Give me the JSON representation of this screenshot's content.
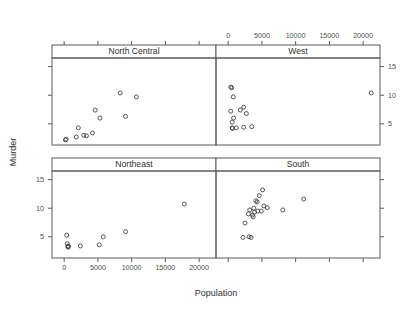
{
  "chart_data": {
    "type": "scatter",
    "title": "",
    "xlabel": "Population",
    "ylabel": "Murder",
    "xlim": [
      -1800,
      22500
    ],
    "ylim": [
      1.3,
      16.5
    ],
    "xticks": [
      0,
      5000,
      10000,
      15000,
      20000
    ],
    "xtick_labels": [
      "0",
      "5000",
      "10000",
      "15000",
      "20000"
    ],
    "yticks": [
      5,
      10,
      15
    ],
    "ytick_labels": [
      "5",
      "10",
      "15"
    ],
    "grid": false,
    "legend": "none",
    "layout": {
      "rows": 2,
      "cols": 2,
      "x_axis_labelled_panels": [
        "North Central",
        "West"
      ],
      "x_axis_label_position": "top-right and bottom-left alternating",
      "y_axis_label_position": "right-top and left-bottom alternating"
    },
    "panels": [
      {
        "name": "North Central",
        "row": 0,
        "col": 0,
        "points": [
          {
            "x": 200,
            "y": 2.2
          },
          {
            "x": 280,
            "y": 2.3
          },
          {
            "x": 1800,
            "y": 2.7
          },
          {
            "x": 2900,
            "y": 3.0
          },
          {
            "x": 3300,
            "y": 2.9
          },
          {
            "x": 4200,
            "y": 3.4
          },
          {
            "x": 2100,
            "y": 4.3
          },
          {
            "x": 5300,
            "y": 6.0
          },
          {
            "x": 4600,
            "y": 7.4
          },
          {
            "x": 9100,
            "y": 6.3
          },
          {
            "x": 8300,
            "y": 10.4
          },
          {
            "x": 10700,
            "y": 9.7
          }
        ]
      },
      {
        "name": "West",
        "row": 0,
        "col": 1,
        "points": [
          {
            "x": 400,
            "y": 11.4
          },
          {
            "x": 520,
            "y": 11.3
          },
          {
            "x": 760,
            "y": 9.7
          },
          {
            "x": 2300,
            "y": 7.9
          },
          {
            "x": 1800,
            "y": 7.4
          },
          {
            "x": 380,
            "y": 7.2
          },
          {
            "x": 2700,
            "y": 6.8
          },
          {
            "x": 800,
            "y": 6.0
          },
          {
            "x": 600,
            "y": 5.3
          },
          {
            "x": 590,
            "y": 4.3
          },
          {
            "x": 640,
            "y": 4.2
          },
          {
            "x": 1200,
            "y": 4.3
          },
          {
            "x": 2300,
            "y": 4.4
          },
          {
            "x": 3500,
            "y": 4.5
          },
          {
            "x": 21200,
            "y": 10.4
          }
        ]
      },
      {
        "name": "Northeast",
        "row": 1,
        "col": 0,
        "points": [
          {
            "x": 380,
            "y": 5.3
          },
          {
            "x": 450,
            "y": 3.8
          },
          {
            "x": 560,
            "y": 3.3
          },
          {
            "x": 600,
            "y": 3.2
          },
          {
            "x": 620,
            "y": 3.4
          },
          {
            "x": 2400,
            "y": 3.4
          },
          {
            "x": 5200,
            "y": 3.6
          },
          {
            "x": 5800,
            "y": 5.0
          },
          {
            "x": 9100,
            "y": 5.9
          },
          {
            "x": 17800,
            "y": 10.7
          }
        ]
      },
      {
        "name": "South",
        "row": 1,
        "col": 1,
        "points": [
          {
            "x": 2200,
            "y": 4.9
          },
          {
            "x": 3100,
            "y": 5.0
          },
          {
            "x": 3400,
            "y": 4.9
          },
          {
            "x": 2500,
            "y": 7.4
          },
          {
            "x": 3600,
            "y": 8.8
          },
          {
            "x": 3200,
            "y": 9.7
          },
          {
            "x": 3900,
            "y": 9.3
          },
          {
            "x": 4400,
            "y": 9.5
          },
          {
            "x": 3800,
            "y": 10.0
          },
          {
            "x": 4900,
            "y": 9.5
          },
          {
            "x": 5300,
            "y": 10.4
          },
          {
            "x": 4300,
            "y": 11.1
          },
          {
            "x": 4600,
            "y": 12.2
          },
          {
            "x": 5100,
            "y": 13.2
          },
          {
            "x": 4100,
            "y": 11.3
          },
          {
            "x": 3000,
            "y": 9.0
          },
          {
            "x": 8100,
            "y": 9.7
          },
          {
            "x": 11200,
            "y": 11.6
          },
          {
            "x": 5800,
            "y": 10.1
          },
          {
            "x": 3700,
            "y": 8.5
          }
        ]
      }
    ]
  },
  "strips": {
    "north_central": "North Central",
    "west": "West",
    "northeast": "Northeast",
    "south": "South"
  },
  "axes": {
    "x_title": "Population",
    "y_title": "Murder",
    "x_top_labels": [
      "0",
      "5000",
      "10000",
      "15000",
      "20000"
    ],
    "x_bottom_labels": [
      "0",
      "5000",
      "10000",
      "15000",
      "20000"
    ],
    "y_right_labels": [
      "15",
      "10",
      "5"
    ],
    "y_left_labels": [
      "15",
      "10",
      "5"
    ]
  },
  "colors": {
    "point_stroke": "#3a3a3a",
    "frame": "#5a5a5a",
    "text": "#4d4d4d",
    "background": "#ffffff"
  }
}
